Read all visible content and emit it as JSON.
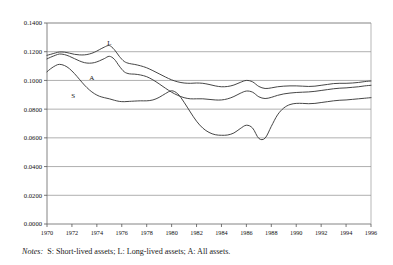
{
  "chart_data": {
    "type": "line",
    "title": "",
    "xlabel": "",
    "ylabel": "",
    "xlim": [
      1970,
      1996
    ],
    "ylim": [
      0.0,
      0.14
    ],
    "grid": true,
    "legend_position": "inline-annotations",
    "ytick_labels": [
      "0.1400",
      "0.1200",
      "0.1000",
      "0.0800",
      "0.0600",
      "0.0400",
      "0.0200",
      "0.0000"
    ],
    "ytick_values": [
      0.14,
      0.12,
      0.1,
      0.08,
      0.06,
      0.04,
      0.02,
      0.0
    ],
    "xtick_labels": [
      "1970",
      "1972",
      "1974",
      "1976",
      "1978",
      "1980",
      "1982",
      "1984",
      "1986",
      "1988",
      "1990",
      "1992",
      "1994",
      "1996"
    ],
    "xtick_values": [
      1970,
      1972,
      1974,
      1976,
      1978,
      1980,
      1982,
      1984,
      1986,
      1988,
      1990,
      1992,
      1994,
      1996
    ],
    "annotations": [
      {
        "text": "L",
        "x": 1975.0,
        "y": 0.1245
      },
      {
        "text": "A",
        "x": 1973.6,
        "y": 0.1005
      },
      {
        "text": "S",
        "x": 1972.1,
        "y": 0.0875
      }
    ],
    "series": [
      {
        "name": "L",
        "label": "Long-lived assets",
        "color": "#3c3c3c",
        "x": [
          1970.0,
          1970.3,
          1970.7,
          1971.0,
          1971.4,
          1971.8,
          1972.2,
          1972.6,
          1973.0,
          1973.4,
          1973.8,
          1974.2,
          1974.6,
          1975.0,
          1975.4,
          1975.8,
          1976.2,
          1976.6,
          1977.0,
          1977.5,
          1978.0,
          1978.5,
          1979.0,
          1979.5,
          1980.0,
          1980.5,
          1981.0,
          1981.5,
          1982.0,
          1982.5,
          1983.0,
          1983.5,
          1984.0,
          1984.5,
          1985.0,
          1985.5,
          1986.0,
          1986.5,
          1987.0,
          1987.5,
          1988.0,
          1988.5,
          1989.0,
          1989.5,
          1990.0,
          1990.5,
          1991.0,
          1991.5,
          1992.0,
          1992.5,
          1993.0,
          1993.5,
          1994.0,
          1994.5,
          1995.0,
          1995.5,
          1996.0
        ],
        "y": [
          0.1175,
          0.1182,
          0.1192,
          0.1198,
          0.1197,
          0.119,
          0.1182,
          0.1178,
          0.1178,
          0.1184,
          0.1196,
          0.1214,
          0.1232,
          0.1243,
          0.1215,
          0.1168,
          0.1132,
          0.1118,
          0.1112,
          0.1102,
          0.1088,
          0.1068,
          0.1046,
          0.1024,
          0.1004,
          0.099,
          0.0982,
          0.098,
          0.0982,
          0.098,
          0.0972,
          0.0962,
          0.0956,
          0.0958,
          0.0968,
          0.0986,
          0.1,
          0.099,
          0.0958,
          0.0944,
          0.0948,
          0.0956,
          0.096,
          0.0962,
          0.0962,
          0.096,
          0.0958,
          0.096,
          0.0966,
          0.0972,
          0.0978,
          0.098,
          0.098,
          0.0982,
          0.0986,
          0.0992,
          0.0996
        ]
      },
      {
        "name": "A",
        "label": "All assets",
        "color": "#3c3c3c",
        "x": [
          1970.0,
          1970.3,
          1970.7,
          1971.0,
          1971.4,
          1971.8,
          1972.2,
          1972.6,
          1973.0,
          1973.4,
          1973.8,
          1974.2,
          1974.6,
          1975.0,
          1975.4,
          1975.8,
          1976.2,
          1976.6,
          1977.0,
          1977.5,
          1978.0,
          1978.5,
          1979.0,
          1979.5,
          1980.0,
          1980.5,
          1981.0,
          1981.5,
          1982.0,
          1982.5,
          1983.0,
          1983.5,
          1984.0,
          1984.5,
          1985.0,
          1985.5,
          1986.0,
          1986.5,
          1987.0,
          1987.5,
          1988.0,
          1988.5,
          1989.0,
          1989.5,
          1990.0,
          1990.5,
          1991.0,
          1991.5,
          1992.0,
          1992.5,
          1993.0,
          1993.5,
          1994.0,
          1994.5,
          1995.0,
          1995.5,
          1996.0
        ],
        "y": [
          0.115,
          0.1162,
          0.1176,
          0.1184,
          0.118,
          0.1168,
          0.1152,
          0.1136,
          0.1124,
          0.112,
          0.1124,
          0.1136,
          0.1152,
          0.1168,
          0.1148,
          0.11,
          0.106,
          0.1046,
          0.1044,
          0.1038,
          0.1026,
          0.1004,
          0.0976,
          0.0946,
          0.0918,
          0.0896,
          0.088,
          0.0872,
          0.0872,
          0.0872,
          0.0868,
          0.0864,
          0.0864,
          0.0872,
          0.0888,
          0.091,
          0.0926,
          0.0918,
          0.0886,
          0.0874,
          0.0882,
          0.0896,
          0.0906,
          0.0912,
          0.0916,
          0.0918,
          0.092,
          0.0924,
          0.093,
          0.0936,
          0.0942,
          0.0946,
          0.0948,
          0.0952,
          0.0956,
          0.0962,
          0.0966
        ]
      },
      {
        "name": "S",
        "label": "Short-lived assets",
        "color": "#3c3c3c",
        "x": [
          1970.0,
          1970.3,
          1970.7,
          1971.0,
          1971.4,
          1971.8,
          1972.2,
          1972.6,
          1973.0,
          1973.4,
          1973.8,
          1974.2,
          1974.6,
          1975.0,
          1975.4,
          1975.8,
          1976.2,
          1976.6,
          1977.0,
          1977.5,
          1978.0,
          1978.5,
          1979.0,
          1979.5,
          1980.0,
          1980.5,
          1981.0,
          1981.5,
          1982.0,
          1982.5,
          1983.0,
          1983.5,
          1984.0,
          1984.5,
          1985.0,
          1985.5,
          1986.0,
          1986.5,
          1987.0,
          1987.5,
          1988.0,
          1988.5,
          1989.0,
          1989.5,
          1990.0,
          1990.5,
          1991.0,
          1991.5,
          1992.0,
          1992.5,
          1993.0,
          1993.5,
          1994.0,
          1994.5,
          1995.0,
          1995.5,
          1996.0
        ],
        "y": [
          0.106,
          0.1082,
          0.1104,
          0.1112,
          0.1104,
          0.1082,
          0.1048,
          0.1008,
          0.0968,
          0.0934,
          0.0908,
          0.089,
          0.088,
          0.0872,
          0.0862,
          0.0854,
          0.0852,
          0.0854,
          0.0856,
          0.0858,
          0.0858,
          0.0864,
          0.0882,
          0.0908,
          0.0928,
          0.0906,
          0.0848,
          0.078,
          0.0716,
          0.0668,
          0.0638,
          0.0622,
          0.0618,
          0.062,
          0.0634,
          0.0664,
          0.0688,
          0.0668,
          0.0596,
          0.0598,
          0.068,
          0.076,
          0.0808,
          0.0832,
          0.084,
          0.084,
          0.0838,
          0.084,
          0.0846,
          0.0852,
          0.0858,
          0.0862,
          0.0864,
          0.0868,
          0.0872,
          0.0876,
          0.088
        ]
      }
    ]
  },
  "notes": {
    "label": "Notes:",
    "text": "S: Short-lived assets; L: Long-lived assets; A: All assets."
  },
  "colors": {
    "line": "#3c3c3c",
    "grid": "#8c8c8c",
    "axis": "#555555",
    "text": "#111111",
    "background": "#ffffff"
  }
}
